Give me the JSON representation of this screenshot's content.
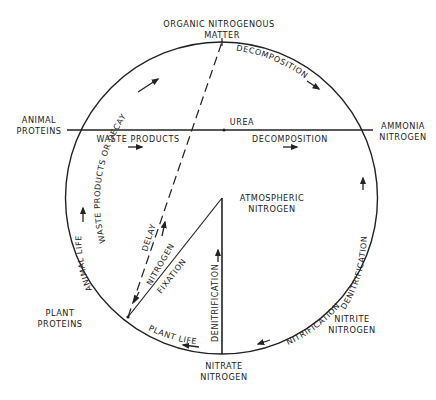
{
  "diagram": {
    "nodes": {
      "organic": [
        "ORGANIC NITROGENOUS",
        "MATTER"
      ],
      "animal_proteins": [
        "ANIMAL",
        "PROTEINS"
      ],
      "ammonia": [
        "AMMONIA",
        "NITROGEN"
      ],
      "atmospheric": [
        "ATMOSPHERIC",
        "NITROGEN"
      ],
      "plant_proteins": [
        "PLANT",
        "PROTEINS"
      ],
      "nitrite": [
        "NITRITE",
        "NITROGEN"
      ],
      "nitrate": [
        "NITRATE",
        "NITROGEN"
      ]
    },
    "edges": {
      "waste_or_decay": "WASTE PRODUCTS OR DECAY",
      "decomposition_arc": "DECOMPOSITION",
      "urea": "UREA",
      "waste_products": "WASTE PRODUCTS",
      "decomposition_line": "DECOMPOSITION",
      "delay": "DELAY",
      "nitrogen": "NITROGEN",
      "fixation": "FIXATION",
      "animal_life": "ANIMAL LIFE",
      "denitrification_vertical": "DENITRIFICATION",
      "denitrification_arc": "DENITRIFICATION",
      "nitrification": "NITRIFICATION",
      "plant_life": "PLANT LIFE"
    },
    "colors": {
      "stroke": "#222222",
      "background": "#ffffff"
    }
  }
}
